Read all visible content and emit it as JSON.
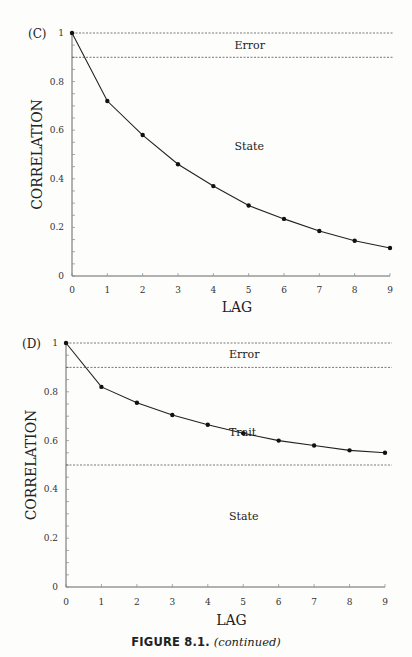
{
  "caption": {
    "figure_label": "FIGURE 8.1.",
    "continued_text": "(continued)"
  },
  "chart_data": [
    {
      "type": "line",
      "panel_label": "(C)",
      "xlabel": "LAG",
      "ylabel": "CORRELATION",
      "x": [
        0,
        1,
        2,
        3,
        4,
        5,
        6,
        7,
        8,
        9
      ],
      "series": [
        {
          "name": "Correlation",
          "values": [
            1.0,
            0.72,
            0.58,
            0.46,
            0.37,
            0.29,
            0.235,
            0.185,
            0.145,
            0.115
          ]
        }
      ],
      "xlim": [
        0,
        9
      ],
      "ylim": [
        0,
        1
      ],
      "xticks": [
        "0",
        "1",
        "2",
        "3",
        "4",
        "5",
        "6",
        "7",
        "8",
        "9"
      ],
      "yticks": [
        "0",
        "0.2",
        "0.4",
        "0.6",
        "0.8",
        "1"
      ],
      "reference_lines": [
        {
          "y": 1.0,
          "style": "dashed"
        },
        {
          "y": 0.9,
          "style": "dashed"
        }
      ],
      "region_labels": [
        {
          "text": "Error",
          "x": 4.6,
          "y": 0.95
        },
        {
          "text": "State",
          "x": 4.6,
          "y": 0.535
        }
      ],
      "grid": false
    },
    {
      "type": "line",
      "panel_label": "(D)",
      "xlabel": "LAG",
      "ylabel": "CORRELATION",
      "x": [
        0,
        1,
        2,
        3,
        4,
        5,
        6,
        7,
        8,
        9
      ],
      "series": [
        {
          "name": "Correlation",
          "values": [
            1.0,
            0.82,
            0.755,
            0.705,
            0.665,
            0.63,
            0.6,
            0.58,
            0.56,
            0.55
          ]
        }
      ],
      "xlim": [
        0,
        9
      ],
      "ylim": [
        0,
        1
      ],
      "xticks": [
        "0",
        "1",
        "2",
        "3",
        "4",
        "5",
        "6",
        "7",
        "8",
        "9"
      ],
      "yticks": [
        "0",
        "0.2",
        "0.4",
        "0.6",
        "0.8",
        "1"
      ],
      "reference_lines": [
        {
          "y": 1.0,
          "style": "dashed"
        },
        {
          "y": 0.9,
          "style": "dashed"
        },
        {
          "y": 0.5,
          "style": "dashed"
        }
      ],
      "region_labels": [
        {
          "text": "Error",
          "x": 4.6,
          "y": 0.955
        },
        {
          "text": "Trait",
          "x": 4.6,
          "y": 0.635
        },
        {
          "text": "State",
          "x": 4.6,
          "y": 0.29
        }
      ],
      "grid": false
    }
  ]
}
